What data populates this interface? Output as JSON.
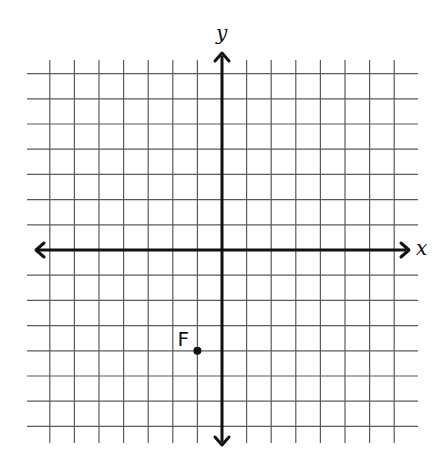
{
  "axes": {
    "x_label": "x",
    "y_label": "y"
  },
  "grid": {
    "x_min": -7,
    "x_max": 7,
    "y_min": -7,
    "y_max": 7,
    "step": 1,
    "tick_labels_shown": false
  },
  "points": [
    {
      "label": "F",
      "x": -1,
      "y": -4
    }
  ],
  "colors": {
    "grid": "#5a5a5a",
    "axis": "#111111",
    "point": "#111111"
  }
}
